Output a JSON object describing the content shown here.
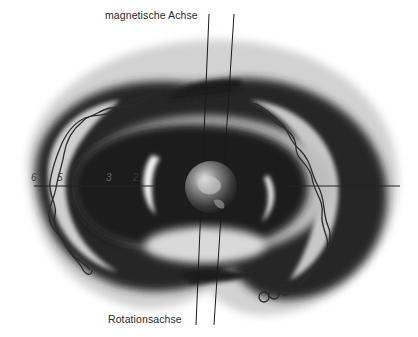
{
  "figure": {
    "labels": {
      "magnetic_axis": "magnetische Achse",
      "rotation_axis": "Rotationsachse"
    },
    "scale_marks": [
      "6",
      "5",
      "3",
      "2"
    ],
    "colors": {
      "background": "#ffffff",
      "belt_dark": "#1e1e1e",
      "belt_mid": "#7a7a7a",
      "belt_light": "#d8d8d8",
      "lines": "#222222"
    }
  }
}
